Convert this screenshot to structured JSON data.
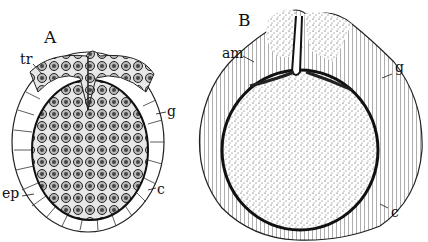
{
  "figure": {
    "panels": [
      {
        "id": "A",
        "label": "A",
        "annotations": [
          {
            "key": "tr",
            "text": "tr"
          },
          {
            "key": "g",
            "text": "g"
          },
          {
            "key": "ep",
            "text": "ep"
          },
          {
            "key": "c",
            "text": "c"
          }
        ]
      },
      {
        "id": "B",
        "label": "B",
        "annotations": [
          {
            "key": "am",
            "text": "am"
          },
          {
            "key": "g",
            "text": "g"
          },
          {
            "key": "c",
            "text": "c"
          }
        ]
      }
    ],
    "colors": {
      "ink": "#111111",
      "paper": "#ffffff",
      "shade": "#555555"
    }
  }
}
